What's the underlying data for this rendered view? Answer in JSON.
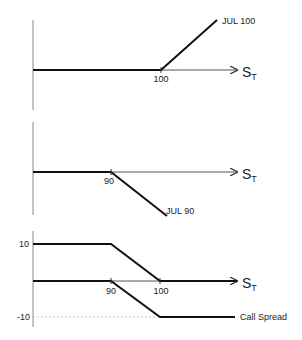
{
  "panels": [
    {
      "name": "long-call-100",
      "strike_label": "100",
      "payoff_label": "JUL 100",
      "axis_label": "S",
      "axis_sub": "T"
    },
    {
      "name": "short-call-90",
      "strike_label": "90",
      "payoff_label": "JUL 90",
      "axis_label": "S",
      "axis_sub": "T"
    },
    {
      "name": "call-spread",
      "strike_labels": [
        "90",
        "100"
      ],
      "y_labels": [
        "10",
        "-10"
      ],
      "payoff_label": "Call Spread",
      "axis_label": "S",
      "axis_sub": "T"
    }
  ],
  "colors": {
    "axis": "#888888",
    "payoff": "#111111",
    "dashed": "#bbbbbb"
  }
}
